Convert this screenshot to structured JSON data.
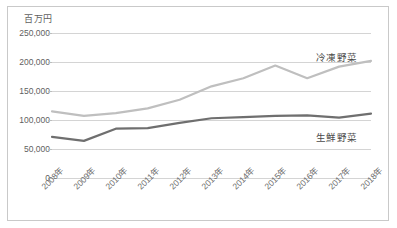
{
  "chart_data": {
    "type": "line",
    "title": "",
    "subtitle": "",
    "xlabel": "",
    "ylabel": "百万円",
    "unit_label": "百万円",
    "categories": [
      "2008年",
      "2009年",
      "2010年",
      "2011年",
      "2012年",
      "2013年",
      "2014年",
      "2015年",
      "2016年",
      "2017年",
      "2018年"
    ],
    "ytick_labels": [
      "250,000",
      "200,000",
      "150,000",
      "100,000",
      "50,000",
      "0"
    ],
    "ytick_values": [
      250000,
      200000,
      150000,
      100000,
      50000,
      0
    ],
    "ylim": [
      0,
      250000
    ],
    "grid": true,
    "legend_position": "inline-right",
    "series": [
      {
        "name": "冷凍野菜",
        "color": "#bfbfbf",
        "values": [
          115000,
          107000,
          112000,
          120000,
          135000,
          158000,
          172000,
          194000,
          172000,
          192000,
          202000
        ]
      },
      {
        "name": "生鮮野菜",
        "color": "#6f6f6f",
        "values": [
          71000,
          64000,
          85000,
          86000,
          95000,
          103000,
          105000,
          107000,
          108000,
          104000,
          111000
        ]
      }
    ],
    "annotations": [
      {
        "text": "冷凍野菜",
        "series": "冷凍野菜"
      },
      {
        "text": "生鮮野菜",
        "series": "生鮮野菜"
      }
    ],
    "colors": {
      "frozen_line": "#bfbfbf",
      "fresh_line": "#6f6f6f",
      "gridline": "#d4d4d4",
      "border": "#c9c9c9",
      "text": "#5f5f5f",
      "background": "#ffffff"
    }
  }
}
